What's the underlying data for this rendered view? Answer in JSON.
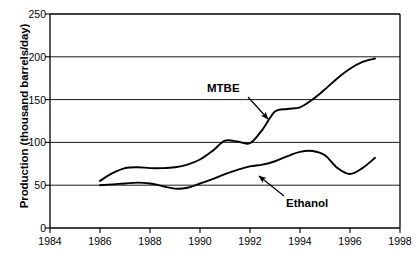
{
  "chart_data": {
    "type": "line",
    "title": "",
    "xlabel": "",
    "ylabel": "Production (thousand barrels/day)",
    "xlim": [
      1984,
      1998
    ],
    "ylim": [
      0,
      250
    ],
    "grid": "horizontal",
    "legend_position": "inline-annotations",
    "x_ticks": [
      "1984",
      "1986",
      "1988",
      "1990",
      "1992",
      "1994",
      "1996",
      "1998"
    ],
    "y_ticks": [
      "0",
      "50",
      "100",
      "150",
      "200",
      "250"
    ],
    "line_color": "#000000",
    "grid_color": "#000000",
    "background_color": "#ffffff",
    "series": [
      {
        "name": "MTBE",
        "annotation_label": "MTBE",
        "x": [
          1986,
          1986.5,
          1987,
          1987.5,
          1988,
          1988.5,
          1989,
          1989.5,
          1990,
          1990.5,
          1991,
          1991.5,
          1992,
          1992.5,
          1993,
          1993.5,
          1994,
          1994.5,
          1995,
          1995.5,
          1996,
          1996.5,
          1997
        ],
        "values": [
          55,
          64,
          70,
          71,
          70,
          70,
          71,
          74,
          80,
          90,
          102,
          101,
          99,
          115,
          136,
          139,
          141,
          150,
          162,
          175,
          186,
          194,
          198
        ]
      },
      {
        "name": "Ethanol",
        "annotation_label": "Ethanol",
        "x": [
          1986,
          1986.5,
          1987,
          1987.5,
          1988,
          1988.5,
          1989,
          1989.5,
          1990,
          1990.5,
          1991,
          1991.5,
          1992,
          1992.5,
          1993,
          1993.5,
          1994,
          1994.5,
          1995,
          1995.5,
          1996,
          1996.5,
          1997
        ],
        "values": [
          50,
          51,
          52,
          53,
          52,
          49,
          46,
          47,
          52,
          57,
          63,
          68,
          72,
          74,
          78,
          84,
          89,
          90,
          85,
          70,
          63,
          70,
          82
        ]
      }
    ],
    "annotations": [
      {
        "text": "MTBE",
        "label_x": 207,
        "label_y": 82,
        "arrow_from_x": 248,
        "arrow_from_y": 97,
        "arrow_to_x": 268,
        "arrow_to_y": 119
      },
      {
        "text": "Ethanol",
        "label_x": 286,
        "label_y": 197,
        "arrow_from_x": 284,
        "arrow_from_y": 196,
        "arrow_to_x": 259,
        "arrow_to_y": 176
      }
    ]
  }
}
